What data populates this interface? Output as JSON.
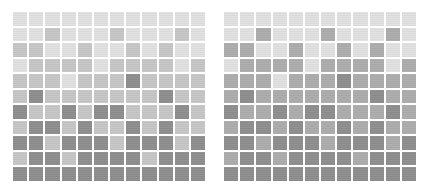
{
  "grids": [
    {
      "name": "left-grid",
      "palette": {
        "1": "#e1e1e1",
        "2": "#c6c6c6",
        "3": "#b0b0b0",
        "4": "#8d8d8d"
      },
      "rows": [
        [
          1,
          1,
          1,
          1,
          1,
          1,
          1,
          1,
          1,
          1,
          1,
          1
        ],
        [
          1,
          1,
          2,
          1,
          1,
          1,
          2,
          1,
          1,
          1,
          2,
          1
        ],
        [
          2,
          2,
          1,
          1,
          2,
          1,
          1,
          2,
          1,
          2,
          1,
          1
        ],
        [
          1,
          2,
          2,
          2,
          2,
          1,
          2,
          2,
          2,
          2,
          1,
          2
        ],
        [
          2,
          2,
          2,
          1,
          2,
          2,
          2,
          4,
          2,
          2,
          2,
          2
        ],
        [
          2,
          4,
          2,
          2,
          2,
          2,
          2,
          2,
          2,
          4,
          2,
          2
        ],
        [
          4,
          2,
          2,
          4,
          2,
          4,
          4,
          2,
          2,
          2,
          4,
          2
        ],
        [
          2,
          4,
          4,
          2,
          4,
          2,
          2,
          4,
          2,
          4,
          2,
          2
        ],
        [
          4,
          4,
          2,
          4,
          4,
          4,
          2,
          4,
          4,
          4,
          2,
          4
        ],
        [
          2,
          4,
          4,
          2,
          4,
          4,
          4,
          4,
          2,
          4,
          4,
          4
        ],
        [
          4,
          4,
          4,
          4,
          4,
          4,
          4,
          4,
          4,
          4,
          4,
          4
        ]
      ]
    },
    {
      "name": "right-grid",
      "palette": {
        "1": "#e1e1e1",
        "2": "#c6c6c6",
        "3": "#acacac",
        "4": "#8d8d8d"
      },
      "rows": [
        [
          1,
          1,
          1,
          1,
          1,
          1,
          1,
          1,
          1,
          1,
          1,
          1
        ],
        [
          1,
          1,
          3,
          1,
          1,
          1,
          3,
          1,
          1,
          1,
          3,
          1
        ],
        [
          3,
          3,
          1,
          1,
          3,
          1,
          1,
          3,
          1,
          3,
          1,
          1
        ],
        [
          1,
          3,
          3,
          3,
          3,
          1,
          3,
          3,
          3,
          3,
          1,
          3
        ],
        [
          3,
          3,
          3,
          1,
          3,
          3,
          3,
          4,
          3,
          3,
          3,
          3
        ],
        [
          3,
          4,
          3,
          3,
          3,
          3,
          3,
          3,
          3,
          4,
          3,
          3
        ],
        [
          4,
          3,
          3,
          4,
          3,
          4,
          4,
          3,
          3,
          3,
          4,
          3
        ],
        [
          3,
          4,
          4,
          3,
          4,
          3,
          3,
          4,
          3,
          4,
          3,
          3
        ],
        [
          4,
          4,
          3,
          4,
          4,
          4,
          3,
          4,
          4,
          4,
          3,
          4
        ],
        [
          3,
          4,
          4,
          3,
          4,
          4,
          4,
          4,
          3,
          4,
          4,
          4
        ],
        [
          4,
          4,
          4,
          4,
          4,
          4,
          4,
          4,
          4,
          4,
          4,
          4
        ]
      ]
    }
  ]
}
